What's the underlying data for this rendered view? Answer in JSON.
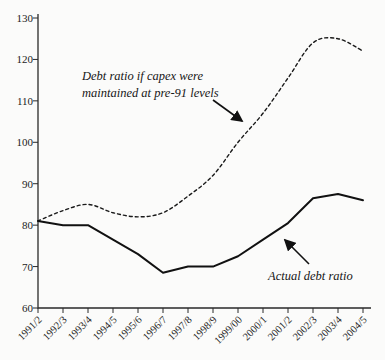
{
  "chart_data": {
    "type": "line",
    "title": "",
    "xlabel": "",
    "ylabel": "",
    "ylim": [
      60,
      130
    ],
    "yticks": [
      60,
      70,
      80,
      90,
      100,
      110,
      120,
      130
    ],
    "grid": false,
    "categories": [
      "1991/2",
      "1992/3",
      "1993/4",
      "1994/5",
      "1995/6",
      "1996/7",
      "1997/8",
      "1998/9",
      "1999/00",
      "2000/1",
      "2001/2",
      "2002/3",
      "2003/4",
      "2004/5"
    ],
    "series": [
      {
        "name": "Debt ratio if capex were maintained at pre-91 levels",
        "line_style": "dashed",
        "color": "#1a1a1a",
        "values": [
          81,
          83.5,
          85,
          83,
          82,
          83,
          87,
          92,
          100,
          107,
          115.5,
          124,
          125,
          122
        ]
      },
      {
        "name": "Actual debt ratio",
        "line_style": "solid",
        "color": "#111111",
        "values": [
          81,
          80,
          80,
          76.5,
          73,
          68.5,
          70,
          70,
          72.5,
          76.5,
          80.5,
          86.5,
          87.5,
          86
        ]
      }
    ],
    "annotations": [
      {
        "lines": [
          "Debt ratio if capex were",
          "maintained at pre-91 levels"
        ],
        "target_series": "dashed",
        "arrow_direction": "down-right"
      },
      {
        "lines": [
          "Actual debt ratio"
        ],
        "target_series": "solid",
        "arrow_direction": "up-left"
      }
    ],
    "colors": {
      "axis": "#2a2a2a",
      "text": "#1c1c1c",
      "background": "#fbfbfa"
    }
  }
}
